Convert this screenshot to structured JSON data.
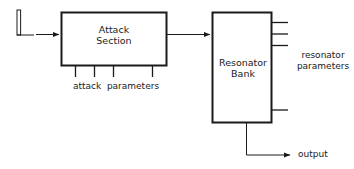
{
  "diagram": {
    "background_color": "#ffffff",
    "line_color": "#1a1a1a",
    "text_color": "#1a1a1a",
    "blocks": [
      {
        "id": "attack-section",
        "label_line1": "Attack",
        "label_line2": "Section"
      },
      {
        "id": "resonator-bank",
        "label_line1": "Resonator",
        "label_line2": "Bank"
      }
    ],
    "labels": {
      "attack_parameters": "attack  parameters",
      "resonator_parameters_line1": "resonator",
      "resonator_parameters_line2": "parameters",
      "output": "output"
    },
    "icons": {
      "impulse": "impulse-waveform-icon",
      "input_arrow": "arrow-right-icon",
      "link_arrow": "arrow-right-icon",
      "output_arrow": "arrow-right-icon"
    },
    "ports": {
      "attack_parameter_count": 4,
      "resonator_parameter_count": 4
    }
  }
}
